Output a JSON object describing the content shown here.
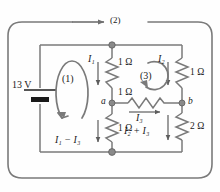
{
  "figure": {
    "type": "circuit-diagram",
    "stroke_color": "#7a7a7a",
    "text_color": "#1a1a1a",
    "background": "#fefefe"
  },
  "source": {
    "voltage_label": "13 V",
    "value": 13,
    "unit": "V",
    "name": "battery"
  },
  "nodes": [
    {
      "id": "a",
      "label": "a"
    },
    {
      "id": "b",
      "label": "b"
    }
  ],
  "resistors": [
    {
      "id": "r-top-middle",
      "label": "1 Ω",
      "value": 1,
      "unit": "Ω",
      "orientation": "vertical"
    },
    {
      "id": "r-top-right",
      "label": "1 Ω",
      "value": 1,
      "unit": "Ω",
      "orientation": "vertical"
    },
    {
      "id": "r-bridge",
      "label": "1 Ω",
      "value": 1,
      "unit": "Ω",
      "orientation": "horizontal"
    },
    {
      "id": "r-bottom-middle",
      "label": "1 Ω",
      "value": 1,
      "unit": "Ω",
      "orientation": "vertical"
    },
    {
      "id": "r-bottom-right",
      "label": "2 Ω",
      "value": 2,
      "unit": "Ω",
      "orientation": "vertical"
    }
  ],
  "loops": [
    {
      "id": "loop-1",
      "label": "(1)",
      "direction": "counterclockwise"
    },
    {
      "id": "loop-2",
      "label": "(2)",
      "direction": "clockwise"
    },
    {
      "id": "loop-3",
      "label": "(3)",
      "direction": "clockwise"
    }
  ],
  "currents": [
    {
      "id": "i1",
      "symbol": "I",
      "subscript": "1",
      "text": "I₁",
      "direction": "down"
    },
    {
      "id": "i2",
      "symbol": "I",
      "subscript": "2",
      "text": "I₂",
      "direction": "down"
    },
    {
      "id": "i3",
      "symbol": "I",
      "subscript": "3",
      "text": "I₃",
      "direction": "right"
    },
    {
      "id": "i1-minus-i3",
      "symbol": "I",
      "subscript": "1-3",
      "text": "I₁ − I₃",
      "direction": "down"
    },
    {
      "id": "i2-plus-i3",
      "symbol": "I",
      "subscript": "2+3",
      "text": "I₂ + I₃",
      "direction": "down"
    }
  ]
}
